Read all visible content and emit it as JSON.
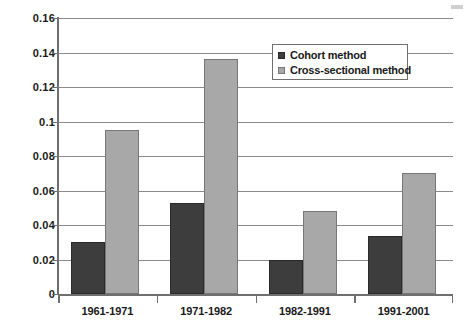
{
  "chart_data": {
    "type": "bar",
    "title": "",
    "subtitle": "",
    "xlabel": "",
    "ylabel": "",
    "categories": [
      "1961-1971",
      "1971-1982",
      "1982-1991",
      "1991-2001"
    ],
    "series": [
      {
        "name": "Cohort method",
        "color": "#3d3d3d",
        "values": [
          0.03,
          0.053,
          0.02,
          0.0335
        ]
      },
      {
        "name": "Cross-sectional method",
        "color": "#a8a8a8",
        "values": [
          0.095,
          0.136,
          0.048,
          0.07
        ]
      }
    ],
    "ylim": [
      0,
      0.16
    ],
    "ytick_values": [
      0,
      0.02,
      0.04,
      0.06,
      0.08,
      0.1,
      0.12,
      0.14,
      0.16
    ],
    "ytick_labels": [
      "0",
      "0.02",
      "0.04",
      "0.06",
      "0.08",
      "0.1",
      "0.12",
      "0.14",
      "0.16"
    ],
    "grid": true,
    "grid_axis": "y",
    "legend_position": "top-right",
    "annotations": []
  },
  "legend": {
    "entries": [
      {
        "label": "Cohort method",
        "marker": "filled-square-dark"
      },
      {
        "label": "Cross-sectional method",
        "marker": "filled-square-gray"
      }
    ]
  }
}
